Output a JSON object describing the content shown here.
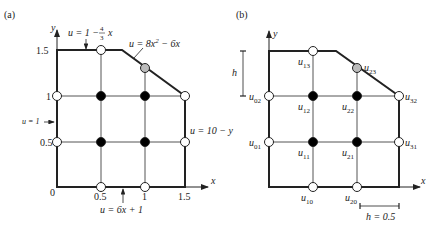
{
  "panel_a": {
    "label": "(a)",
    "axis_x_label": "x",
    "axis_y_label": "y",
    "x_ticks": [
      "0",
      "0.5",
      "1",
      "1.5"
    ],
    "y_ticks": [
      "0.5",
      "1",
      "1.5"
    ],
    "bc_top": "u = 1 − (4/3) x",
    "bc_top_parts": {
      "lhs": "u = 1 − ",
      "num": "4",
      "den": "3",
      "var": "x"
    },
    "bc_diag": "u = 8x² − 6x",
    "bc_diag_parts": {
      "lhs": "u = 8x",
      "exp": "2",
      "rest": " − 6x"
    },
    "bc_left": "u = 1",
    "bc_right": "u = 10 − y",
    "bc_bottom": "u = 6x + 1"
  },
  "panel_b": {
    "label": "(b)",
    "axis_x_label": "x",
    "axis_y_label": "y",
    "h_label": "h",
    "h_value_label": "h = 0.5",
    "nodes": [
      {
        "name": "u",
        "sub": "13"
      },
      {
        "name": "u",
        "sub": "23"
      },
      {
        "name": "u",
        "sub": "02"
      },
      {
        "name": "u",
        "sub": "12"
      },
      {
        "name": "u",
        "sub": "22"
      },
      {
        "name": "u",
        "sub": "32"
      },
      {
        "name": "u",
        "sub": "01"
      },
      {
        "name": "u",
        "sub": "11"
      },
      {
        "name": "u",
        "sub": "21"
      },
      {
        "name": "u",
        "sub": "31"
      },
      {
        "name": "u",
        "sub": "10"
      },
      {
        "name": "u",
        "sub": "20"
      }
    ]
  },
  "colors": {
    "line": "#222222",
    "grid": "#555555",
    "node_interior": "#000000",
    "node_boundary": "#ffffff",
    "node_diag": "#bbbbbb"
  }
}
